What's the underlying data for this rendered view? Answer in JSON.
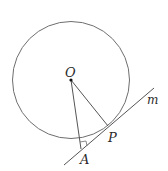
{
  "diagram": {
    "type": "geometry",
    "labels": {
      "center": "O",
      "tangent_point": "P",
      "external_point": "A",
      "line": "m"
    },
    "colors": {
      "stroke": "#6e6e6e",
      "text": "#2a2a2a",
      "background": "#ffffff"
    }
  }
}
